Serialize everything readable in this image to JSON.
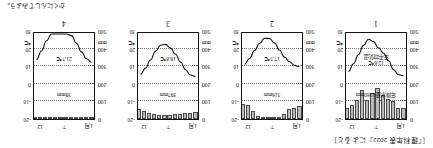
{
  "figure": {
    "caption": "［『理科年表 2022』によると］",
    "source_note": "かくにんしてみよう。"
  },
  "axes": {
    "precip_unit": "mm",
    "temp_unit": "℃",
    "precip_ticks": [
      "0",
      "100",
      "200",
      "300",
      "400",
      "500"
    ],
    "temp_ticks": [
      "-20",
      "-10",
      "0",
      "10",
      "20",
      "30"
    ],
    "month_ticks": [
      "1月",
      "7",
      "12"
    ]
  },
  "chart_data": [
    {
      "type": "bar",
      "title": "1",
      "number_label": "1",
      "xlabel": "",
      "ylabel": "mm",
      "ylim": [
        0,
        500
      ],
      "y2label": "℃",
      "y2lim": [
        -20,
        30
      ],
      "grid": true,
      "categories": [
        "1",
        "2",
        "3",
        "4",
        "5",
        "6",
        "7",
        "8",
        "9",
        "10",
        "11",
        "12"
      ],
      "annotations": {
        "precipitation": "年降水量 1260mm",
        "temperature": "年平均気温\n12.6℃",
        "temperature_line1": "年平均気温",
        "temperature_line2": "12.6℃"
      },
      "series": [
        {
          "name": "降水量",
          "type": "bar",
          "values": [
            60,
            65,
            105,
            115,
            135,
            175,
            150,
            110,
            165,
            110,
            80,
            60
          ]
        },
        {
          "name": "気温",
          "type": "line",
          "values": [
            5.2,
            5.7,
            8.7,
            13.9,
            18.2,
            21.4,
            25.0,
            26.4,
            22.8,
            17.5,
            12.1,
            7.6
          ]
        }
      ]
    },
    {
      "type": "bar",
      "title": "2",
      "number_label": "2",
      "xlabel": "",
      "ylabel": "mm",
      "ylim": [
        0,
        500
      ],
      "y2label": "℃",
      "y2lim": [
        -20,
        30
      ],
      "grid": true,
      "categories": [
        "1",
        "2",
        "3",
        "4",
        "5",
        "6",
        "7",
        "8",
        "9",
        "10",
        "11",
        "12"
      ],
      "annotations": {
        "precipitation": "516mm",
        "temperature": "17.5℃"
      },
      "series": [
        {
          "name": "降水量",
          "type": "bar",
          "values": [
            75,
            65,
            55,
            30,
            12,
            5,
            2,
            3,
            18,
            48,
            80,
            88
          ]
        },
        {
          "name": "気温",
          "type": "line",
          "values": [
            10.5,
            11.2,
            13.3,
            16.0,
            20.1,
            24.2,
            26.8,
            26.9,
            23.9,
            19.8,
            15.2,
            11.8
          ]
        }
      ]
    },
    {
      "type": "bar",
      "title": "3",
      "number_label": "3",
      "xlabel": "",
      "ylabel": "mm",
      "ylim": [
        0,
        500
      ],
      "y2label": "℃",
      "y2lim": [
        -20,
        30
      ],
      "grid": true,
      "categories": [
        "1",
        "2",
        "3",
        "4",
        "5",
        "6",
        "7",
        "8",
        "9",
        "10",
        "11",
        "12"
      ],
      "annotations": {
        "precipitation": "397mm",
        "temperature": "18.8℃"
      },
      "series": [
        {
          "name": "降水量",
          "type": "bar",
          "values": [
            38,
            36,
            34,
            30,
            26,
            22,
            20,
            22,
            28,
            36,
            48,
            57
          ]
        },
        {
          "name": "気温",
          "type": "line",
          "values": [
            4.8,
            5.6,
            8.6,
            13.1,
            17.6,
            21.2,
            23.4,
            22.9,
            19.4,
            14.3,
            9.6,
            6.0
          ]
        }
      ]
    },
    {
      "type": "bar",
      "title": "4",
      "number_label": "4",
      "xlabel": "",
      "ylabel": "mm",
      "ylim": [
        0,
        500
      ],
      "y2label": "℃",
      "y2lim": [
        -20,
        30
      ],
      "grid": true,
      "categories": [
        "1",
        "2",
        "3",
        "4",
        "5",
        "6",
        "7",
        "8",
        "9",
        "10",
        "11",
        "12"
      ],
      "annotations": {
        "precipitation": "38mm",
        "temperature": "21.7℃"
      },
      "series": [
        {
          "name": "降水量",
          "type": "bar",
          "values": [
            3,
            3,
            4,
            3,
            2,
            1,
            0,
            0,
            1,
            3,
            5,
            5
          ]
        },
        {
          "name": "気温",
          "type": "line",
          "values": [
            13.0,
            15.0,
            19.0,
            24.0,
            28.5,
            32.0,
            34.0,
            33.5,
            30.5,
            25.5,
            19.5,
            14.5
          ]
        }
      ]
    }
  ]
}
